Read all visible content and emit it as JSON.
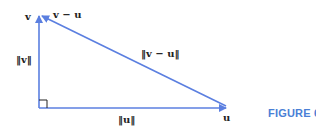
{
  "figure": {
    "caption": "FIGURE 6.2",
    "caption_color": "#4a7fd6",
    "line_color": "#5b7fe0"
  },
  "labels": {
    "v": "v",
    "v_minus_u": "v − u",
    "norm_v": "‖v‖",
    "norm_v_minus_u": "‖v − u‖",
    "u": "u",
    "norm_u": "‖u‖"
  }
}
